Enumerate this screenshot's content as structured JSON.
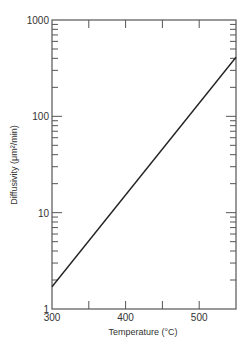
{
  "chart_data": {
    "type": "line",
    "title": "",
    "xlabel": "Temperature (°C)",
    "ylabel": "Diffusivity (μm²/min)",
    "xscale": "linear",
    "yscale": "log",
    "xlim": [
      300,
      550
    ],
    "ylim": [
      1,
      1000
    ],
    "x_ticks": [
      300,
      350,
      400,
      450,
      500,
      550
    ],
    "x_tick_labels": [
      "300",
      "400",
      "500"
    ],
    "x_tick_label_values": [
      300,
      400,
      500
    ],
    "y_major_ticks": [
      1,
      10,
      100,
      1000
    ],
    "y_tick_labels": [
      "1",
      "10",
      "100",
      "1000"
    ],
    "grid": false,
    "legend": "none",
    "series": [
      {
        "name": "diffusivity",
        "x": [
          300,
          550
        ],
        "y": [
          1.7,
          410
        ]
      }
    ],
    "colors": {
      "line": "#222222",
      "axis": "#555555",
      "text": "#333333"
    }
  }
}
